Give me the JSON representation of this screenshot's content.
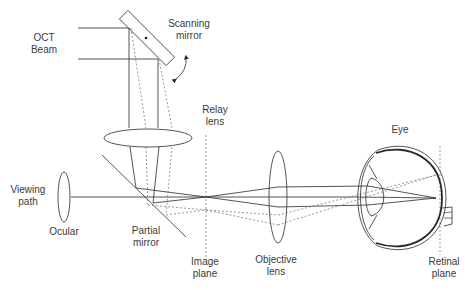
{
  "diagram": {
    "colors": {
      "line": "#2a2a2a",
      "dashed": "#6a6a6a",
      "text": "#3a3a3a",
      "background": "#ffffff"
    },
    "labels": {
      "oct_beam": "OCT\nBeam",
      "scanning_mirror": "Scanning\nmirror",
      "relay_lens": "Relay\nlens",
      "eye": "Eye",
      "viewing_path": "Viewing\npath",
      "ocular": "Ocular",
      "partial_mirror": "Partial\nmirror",
      "image_plane": "Image\nplane",
      "objective_lens": "Objective\nlens",
      "retinal_plane": "Retinal\nplane"
    },
    "components": [
      "OCT Beam",
      "Scanning mirror",
      "Relay lens",
      "Partial mirror",
      "Ocular",
      "Image plane",
      "Objective lens",
      "Eye",
      "Retinal plane",
      "Viewing path"
    ],
    "icons": {
      "rotation_arrow": "curved-double-arrow-icon"
    }
  }
}
